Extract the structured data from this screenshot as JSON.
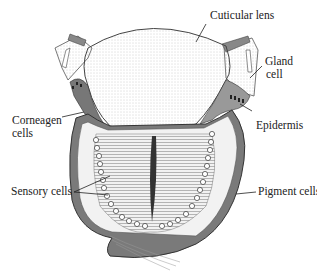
{
  "diagram": {
    "type": "anatomical-illustration",
    "labels": [
      {
        "id": "cuticular-lens",
        "text": "Cuticular lens"
      },
      {
        "id": "gland-cell-1",
        "text": "Gland"
      },
      {
        "id": "gland-cell-2",
        "text": "cell"
      },
      {
        "id": "corneagen-1",
        "text": "Corneagen"
      },
      {
        "id": "corneagen-2",
        "text": "cells"
      },
      {
        "id": "epidermis",
        "text": "Epidermis"
      },
      {
        "id": "sensory-cells",
        "text": "Sensory cells"
      },
      {
        "id": "pigment-cells",
        "text": "Pigment cells"
      }
    ],
    "colors": {
      "ink": "#222222",
      "shading": "#8a8a8a",
      "dark_tissue": "#555555",
      "background": "#ffffff"
    }
  }
}
